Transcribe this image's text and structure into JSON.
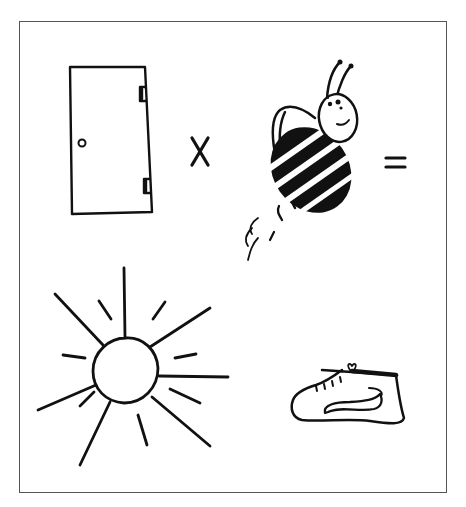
{
  "puzzle": {
    "type": "rebus",
    "description": "Picture rebus: door × bee = sun + shoe",
    "row1": [
      {
        "item": "door",
        "icon": "door-icon"
      },
      {
        "item": "times",
        "icon": "multiply-sign",
        "glyph": "X"
      },
      {
        "item": "bee",
        "icon": "bee-icon"
      },
      {
        "item": "equals",
        "icon": "equals-sign",
        "glyph": "="
      }
    ],
    "row2": [
      {
        "item": "sun",
        "icon": "sun-icon"
      },
      {
        "item": "shoe",
        "icon": "sneaker-icon"
      }
    ]
  },
  "colors": {
    "ink": "#111111",
    "frame": "#555555",
    "background": "#ffffff"
  }
}
